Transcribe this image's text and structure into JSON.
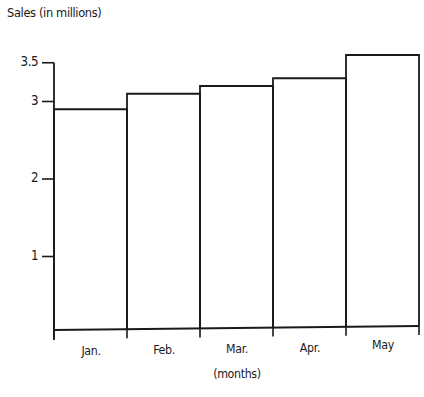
{
  "chart_data": {
    "type": "bar",
    "title": "",
    "ylabel": "Sales (in millions)",
    "xlabel": "(months)",
    "categories": [
      "Jan.",
      "Feb.",
      "Mar.",
      "Apr.",
      "May"
    ],
    "values": [
      2.9,
      3.1,
      3.2,
      3.3,
      3.6
    ],
    "yticks": [
      1,
      2,
      3,
      3.5
    ],
    "ytick_labels": [
      "1",
      "2",
      "3",
      "3.5"
    ],
    "ylim": [
      0,
      3.6
    ],
    "grid": false,
    "legend": null,
    "bar_fill": "#ffffff",
    "bar_stroke": "#1a1a1a"
  }
}
